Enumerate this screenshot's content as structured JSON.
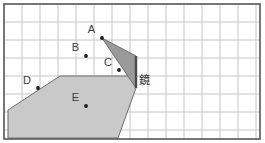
{
  "figure": {
    "width": 265,
    "height": 143,
    "background_color": "#ffffff",
    "frame": {
      "x": 4,
      "y": 4,
      "width": 256,
      "height": 135,
      "stroke_color": "#555555",
      "stroke_width": 1.6
    },
    "grid": {
      "cell_size": 18,
      "line_color": "#bfbfbf",
      "line_width": 0.9,
      "visible": true,
      "columns": 14,
      "rows": 7
    },
    "mirror": {
      "label": "鏡",
      "label_x": 139,
      "label_y": 84,
      "x": 136,
      "y_top": 56,
      "y_bottom": 88,
      "stroke_color": "#4a4a4a",
      "stroke_width": 2.4
    },
    "colors": {
      "dark_region_fill": "#9a9a9a",
      "light_region_fill": "#c9c9c9",
      "region_stroke": "#6e6e6e",
      "point_color": "#1a1a1a",
      "label_color": "#3a3a3a"
    },
    "points": [
      {
        "id": "A",
        "label": "A",
        "x": 102,
        "y": 38,
        "label_x": 95,
        "label_y": 33,
        "label_anchor": "end"
      },
      {
        "id": "B",
        "label": "B",
        "x": 86,
        "y": 56,
        "label_x": 79,
        "label_y": 51,
        "label_anchor": "end"
      },
      {
        "id": "C",
        "label": "C",
        "x": 119,
        "y": 70,
        "label_x": 112,
        "label_y": 66,
        "label_anchor": "end"
      },
      {
        "id": "D",
        "label": "D",
        "x": 38,
        "y": 88,
        "label_x": 31,
        "label_y": 84,
        "label_anchor": "end"
      },
      {
        "id": "E",
        "label": "E",
        "x": 86,
        "y": 106,
        "label_x": 79,
        "label_y": 101,
        "label_anchor": "end"
      }
    ],
    "regions": [
      {
        "id": "light-beam-region",
        "name": "light-shaded-beam",
        "fill": "#c9c9c9",
        "points": "8,110 8,138 118,138 136,88 136,76 60,76"
      },
      {
        "id": "dark-cone-region",
        "name": "dark-shaded-cone",
        "fill": "#9a9a9a",
        "points": "102,38 136,56 136,88"
      }
    ]
  }
}
